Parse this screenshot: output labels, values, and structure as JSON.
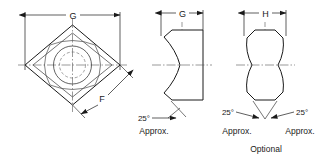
{
  "figure": {
    "type": "engineering-drawing",
    "background_color": "#ffffff",
    "line_color": "#1a1a1a",
    "centerline_color": "#555555",
    "hidden_line_color": "#777777"
  },
  "views": {
    "plan": {
      "name": "plan-view",
      "dimensions": [
        {
          "id": "G",
          "label": "G",
          "orientation": "horizontal",
          "position": "top",
          "spans": "overall-width-across-corners"
        },
        {
          "id": "F",
          "label": "F",
          "orientation": "diagonal",
          "position": "lower-right",
          "spans": "flat-face-width"
        }
      ],
      "geometry": {
        "outer": "diamond-square-rotated-45",
        "inner": "rounded-square-inscribed",
        "circles": [
          "solid-circle",
          "dashed-hidden-circle"
        ],
        "centerlines": [
          "horizontal",
          "vertical"
        ]
      }
    },
    "front": {
      "name": "front-view",
      "dimensions": [
        {
          "id": "G",
          "label": "G",
          "orientation": "horizontal",
          "position": "top",
          "spans": "width"
        }
      ],
      "annotations": [
        {
          "angle": "25°",
          "note": "Approx.",
          "side": "left"
        }
      ],
      "geometry": {
        "right_edge": "flat",
        "left_edge": "double-arc-chamfer",
        "centerline": "horizontal"
      }
    },
    "side": {
      "name": "side-view",
      "title": "Optional",
      "dimensions": [
        {
          "id": "H",
          "label": "H",
          "orientation": "horizontal",
          "position": "top",
          "spans": "width"
        }
      ],
      "annotations": [
        {
          "angle": "25°",
          "note": "Approx.",
          "side": "left"
        },
        {
          "angle": "25°",
          "note": "Approx.",
          "side": "right"
        }
      ],
      "geometry": {
        "profile": "symmetric-double-lobe",
        "centerline": "horizontal"
      }
    }
  },
  "labels": {
    "dim_G_plan": "G",
    "dim_F_plan": "F",
    "dim_G_front": "G",
    "dim_H_side": "H",
    "angle_front": "25°",
    "approx_front": "Approx.",
    "angle_side_left": "25°",
    "approx_side_left": "Approx.",
    "angle_side_right": "25°",
    "approx_side_right": "Approx.",
    "optional_caption": "Optional"
  }
}
